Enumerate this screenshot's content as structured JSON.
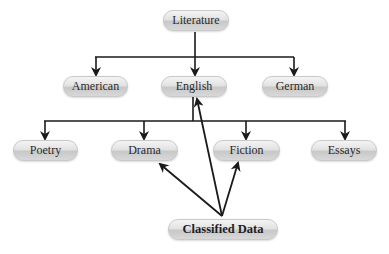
{
  "diagram": {
    "type": "hierarchy",
    "nodes": {
      "root": "Literature",
      "level1": [
        "American",
        "English",
        "German"
      ],
      "level2": [
        "Poetry",
        "Drama",
        "Fiction",
        "Essays"
      ],
      "source": "Classified Data"
    },
    "edges": [
      {
        "from": "Literature",
        "to": "American"
      },
      {
        "from": "Literature",
        "to": "English"
      },
      {
        "from": "Literature",
        "to": "German"
      },
      {
        "from": "English",
        "to": "Poetry"
      },
      {
        "from": "English",
        "to": "Drama"
      },
      {
        "from": "English",
        "to": "Fiction"
      },
      {
        "from": "English",
        "to": "Essays"
      },
      {
        "from": "Classified Data",
        "to": "Drama"
      },
      {
        "from": "Classified Data",
        "to": "English"
      },
      {
        "from": "Classified Data",
        "to": "Fiction"
      }
    ],
    "colors": {
      "edge": "#1a1a1a",
      "node_fill": "#dcdcdc",
      "node_border": "#c9c9c9",
      "text": "#2a2a2a"
    }
  }
}
